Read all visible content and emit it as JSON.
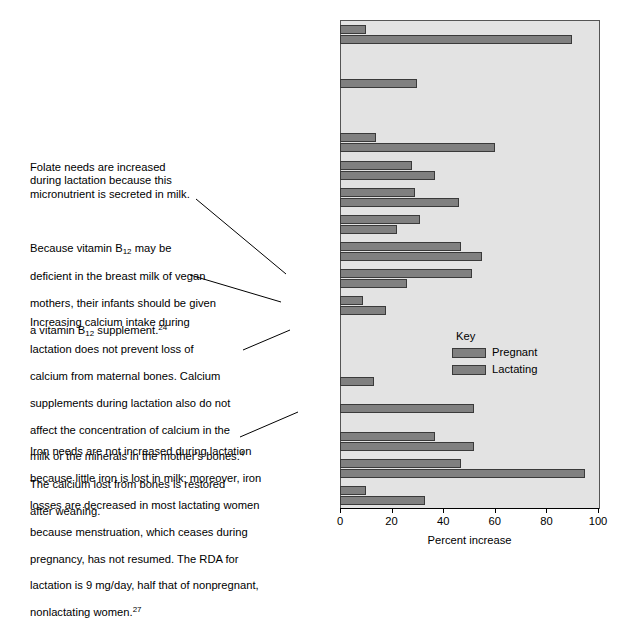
{
  "chart_data": {
    "type": "bar",
    "orientation": "horizontal",
    "title": "",
    "xlabel": "Percent increase",
    "ylabel": "",
    "xlim": [
      0,
      100
    ],
    "xticks": [
      0,
      20,
      40,
      60,
      80,
      100
    ],
    "grid": false,
    "legend_title": "Key",
    "legend_position": "inside-right-middle",
    "categories": [
      "Vitamin A",
      "Vitamin D",
      "Vitamin E",
      "Vitamin K",
      "Vitamin C",
      "Thiamin",
      "Riboflavin",
      "Niacin",
      "Vitamin B6",
      "Folate",
      "Vitamin B12",
      "Calcium",
      "Phosphorus",
      "Magnesium",
      "Iron",
      "Zinc",
      "Iodine",
      "Selenium"
    ],
    "category_labels_html": [
      "Vitamin A",
      "Vitamin D",
      "Vitamin E",
      "Vitamin K",
      "Vitamin C",
      "Thiamin",
      "Riboflavin",
      "Niacin",
      "Vitamin B<sub>6</sub>",
      "Folate",
      "Vitamin B<sub>12</sub>",
      "Calcium",
      "Phosphorus",
      "Magnesium",
      "Iron",
      "Zinc",
      "Iodine",
      "Selenium"
    ],
    "series": [
      {
        "name": "Pregnant",
        "color": "#808080",
        "values": [
          10,
          0,
          30,
          0,
          14,
          28,
          29,
          31,
          47,
          51,
          9,
          0,
          0,
          13,
          52,
          37,
          47,
          10
        ]
      },
      {
        "name": "Lactating",
        "color": "#808080",
        "values": [
          90,
          0,
          0,
          0,
          60,
          37,
          46,
          22,
          55,
          26,
          18,
          0,
          0,
          0,
          0,
          52,
          95,
          33
        ]
      }
    ]
  },
  "annotations": [
    {
      "id": "folate-note",
      "text": "Folate needs are increased\nduring lactation because this\nmicronutrient is secreted in milk.",
      "target": "Folate"
    },
    {
      "id": "b12-note",
      "target": "Vitamin B12",
      "line1": "Because vitamin B",
      "sub1": "12",
      "line1b": " may be",
      "line2": "deficient in the breast milk of vegan",
      "line3": "mothers, their infants should be given",
      "line4a": "a vitamin B",
      "sub2": "12",
      "line4b": " supplement.",
      "sup1": "24"
    },
    {
      "id": "calcium-note",
      "target": "Calcium",
      "line1": "Increasing calcium intake during",
      "line2": "lactation does not prevent loss of",
      "line3": "calcium from maternal  bones. Calcium",
      "line4": "supplements during lactation also do not",
      "line5": "affect the concentration of calcium in the",
      "line6a": "milk or the minerals in the mother's bones.",
      "sup1": "4",
      "line7": "The calcium lost from bones is restored",
      "line8": "after weaning."
    },
    {
      "id": "iron-note",
      "target": "Iron",
      "line1": "Iron needs are not increased during lactation",
      "line2": "because little iron is lost in milk; moreover, iron",
      "line3": "losses are decreased in most lactating women",
      "line4": "because menstruation, which ceases during",
      "line5": "pregnancy, has not resumed. The RDA for",
      "line6a": "lactation is 9 mg/day, half that of nonpregnant,",
      "line7a": "nonlactating women.",
      "sup1": "27"
    }
  ],
  "colors": {
    "plot_background": "#e3e3e3",
    "bar_fill": "#808080",
    "bar_outline": "#3a3a3a",
    "frame": "#555555",
    "text": "#000000"
  }
}
